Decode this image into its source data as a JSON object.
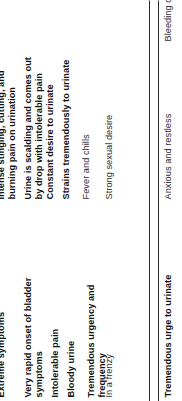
{
  "document": {
    "type": "scanned-page-fragment",
    "orientation": "rotated-90-ccw",
    "rule_color": "#2b2b2b",
    "text_color": "#1a1a1a"
  },
  "primary_column": {
    "entries": [
      {
        "text": "Extreme symptoms",
        "weight": "bold"
      },
      {
        "text": "Very rapid onset of bladder symptoms",
        "weight": "bold"
      },
      {
        "text": "Intolerable pain",
        "weight": "bold"
      },
      {
        "text": "Bloody urine",
        "weight": "bold"
      },
      {
        "text": "Tremendous urgency and frequency",
        "weight": "bold"
      },
      {
        "text": "In a frenzy",
        "weight": "plain"
      }
    ]
  },
  "secondary_column": {
    "entries": [
      {
        "text": "Intense stinging, cutting, and burning pain on urination",
        "weight": "bold"
      },
      {
        "text": "Urine is scalding and comes out by drop with intolerable pain",
        "weight": "bold"
      },
      {
        "text": "Constant desire to urinate",
        "weight": "bold"
      },
      {
        "text": "Strains tremendously to urinate",
        "weight": "bold"
      },
      {
        "text": "Fever and chills",
        "weight": "plain"
      },
      {
        "text": "Strong sexual desire",
        "weight": "plain"
      }
    ]
  },
  "footer_row": {
    "entries": [
      {
        "text": "Tremendous urge to urinate",
        "weight": "bold"
      },
      {
        "text": "Anxious and restless",
        "weight": "plain"
      },
      {
        "text": "Bleeding of urethra after urination",
        "weight": "plain"
      }
    ]
  }
}
